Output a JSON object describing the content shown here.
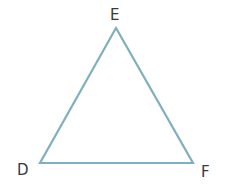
{
  "diagram": {
    "type": "triangle",
    "stroke_color": "#7fb0bf",
    "vertices": [
      {
        "label": "E",
        "position": "top"
      },
      {
        "label": "D",
        "position": "bottom-left"
      },
      {
        "label": "F",
        "position": "bottom-right"
      }
    ]
  }
}
